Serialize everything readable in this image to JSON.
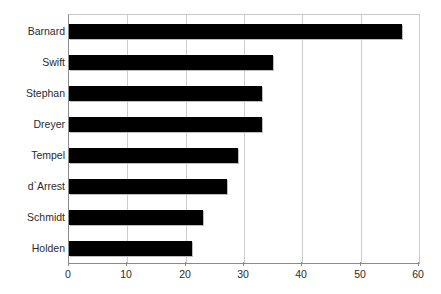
{
  "chart_data": {
    "type": "bar",
    "orientation": "horizontal",
    "title": "",
    "subtitle": "",
    "xlabel": "",
    "ylabel": "",
    "categories": [
      "Barnard",
      "Swift",
      "Stephan",
      "Dreyer",
      "Tempel",
      "d`Arrest",
      "Schmidt",
      "Holden"
    ],
    "values": [
      57,
      35,
      33,
      33,
      29,
      27,
      23,
      21
    ],
    "series": [
      {
        "name": "",
        "values": [
          57,
          35,
          33,
          33,
          29,
          27,
          23,
          21
        ]
      }
    ],
    "xlim": [
      0,
      60
    ],
    "xticks": [
      0,
      10,
      20,
      30,
      40,
      50,
      60
    ],
    "xtick_labels": [
      "0",
      "10",
      "20",
      "30",
      "40",
      "50",
      "60"
    ],
    "grid": "vertical",
    "legend": "none",
    "bar_color": "#000000",
    "grid_color": "#cccccc",
    "axis_color": "#8a8a8a",
    "background_color": "#ffffff",
    "text_color": "#2b2b2b"
  }
}
